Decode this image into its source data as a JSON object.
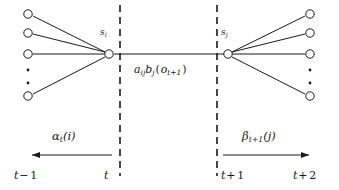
{
  "figure": {
    "type": "hmm-forward-backward-trellis",
    "line_color": "#1a1a1a",
    "background_color": "#ffffff",
    "node_fill": "#ffffff"
  },
  "states": {
    "left_label": {
      "base": "s",
      "sub": "i"
    },
    "right_label": {
      "base": "s",
      "sub": "j"
    }
  },
  "center": {
    "transition_emission": {
      "a_base": "a",
      "a_sub": "ij",
      "b_base": "b",
      "b_sub": "j",
      "open_paren": "(",
      "o_base": "o",
      "o_sub": "t+1",
      "close_paren": ")"
    }
  },
  "arrows": {
    "left": {
      "label": {
        "base": "α",
        "sub": "t",
        "arg": "(i)"
      },
      "direction": "left"
    },
    "right": {
      "label": {
        "base": "β",
        "sub": "t+1",
        "arg": "(j)"
      },
      "direction": "right"
    }
  },
  "time_axis": {
    "ticks": [
      {
        "base": "t",
        "op": "−",
        "num": "1"
      },
      {
        "base": "t",
        "op": "",
        "num": ""
      },
      {
        "base": "t",
        "op": "+",
        "num": "1"
      },
      {
        "base": "t",
        "op": "+",
        "num": "2"
      }
    ]
  },
  "nodes": {
    "left_column": [
      {
        "cx": 28,
        "cy": 14
      },
      {
        "cx": 28,
        "cy": 33
      },
      {
        "cx": 28,
        "cy": 54
      },
      {
        "cx": 28,
        "cy": 96
      }
    ],
    "left_ellipsis": [
      {
        "cx": 28,
        "cy": 70
      },
      {
        "cx": 28,
        "cy": 83
      }
    ],
    "right_column": [
      {
        "cx": 310,
        "cy": 14
      },
      {
        "cx": 310,
        "cy": 33
      },
      {
        "cx": 310,
        "cy": 54
      },
      {
        "cx": 310,
        "cy": 96
      }
    ],
    "right_ellipsis": [
      {
        "cx": 310,
        "cy": 70
      },
      {
        "cx": 310,
        "cy": 83
      }
    ],
    "hub_left": {
      "cx": 109,
      "cy": 54
    },
    "hub_right": {
      "cx": 228,
      "cy": 54
    }
  },
  "dashed_lines": [
    {
      "x": 120,
      "y1": 5,
      "y2": 176
    },
    {
      "x": 217,
      "y1": 5,
      "y2": 176
    }
  ]
}
